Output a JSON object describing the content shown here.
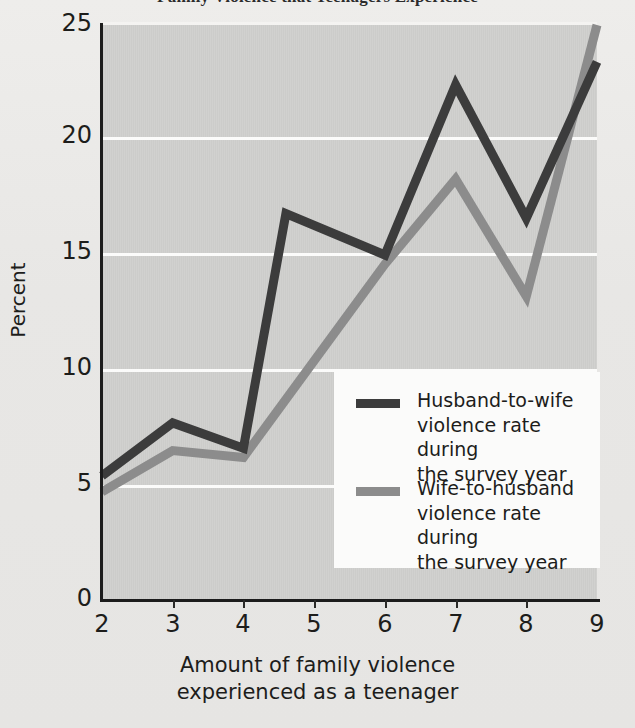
{
  "title": "Family Violence that Teenagers Experience",
  "axes": {
    "ylabel": "Percent",
    "xlabel_line1": "Amount of family violence",
    "xlabel_line2": "experienced as a teenager",
    "yticks": [
      "0",
      "5",
      "10",
      "15",
      "20",
      "25"
    ],
    "xticks": [
      "2",
      "3",
      "4",
      "5",
      "6",
      "7",
      "8",
      "9"
    ]
  },
  "legend": {
    "items": [
      {
        "label": "Husband-to-wife\nviolence rate during\nthe survey year",
        "color": "#3c3c3c"
      },
      {
        "label": "Wife-to-husband\nviolence rate during\nthe survey year",
        "color": "#8c8c8c"
      }
    ]
  },
  "colors": {
    "plot_background": "#cfcfcd",
    "page_background": "#e9e8e6",
    "gridline": "#fbfbfa",
    "axis": "#1c1c1c",
    "series_dark": "#3c3c3c",
    "series_gray": "#8c8c8c"
  },
  "chart_data": {
    "type": "line",
    "title": "Family Violence that Teenagers Experience",
    "xlabel": "Amount of family violence experienced as a teenager",
    "ylabel": "Percent",
    "xlim": [
      2,
      9
    ],
    "ylim": [
      0,
      25
    ],
    "yticks": [
      0,
      5,
      10,
      15,
      20,
      25
    ],
    "xticks": [
      2,
      3,
      4,
      5,
      6,
      7,
      8,
      9
    ],
    "grid": "horizontal",
    "legend_position": "center-right",
    "series": [
      {
        "name": "Husband-to-wife violence rate during the survey year",
        "color": "#3c3c3c",
        "x": [
          2,
          3,
          4,
          4.6,
          6,
          7,
          8,
          9
        ],
        "values": [
          5.4,
          7.7,
          6.6,
          16.8,
          15.0,
          22.4,
          16.6,
          23.4
        ]
      },
      {
        "name": "Wife-to-husband violence rate during the survey year",
        "color": "#8c8c8c",
        "x": [
          2,
          3,
          4,
          6,
          7,
          8,
          9
        ],
        "values": [
          4.7,
          6.5,
          6.2,
          14.6,
          18.3,
          13.2,
          25.0
        ]
      }
    ]
  }
}
